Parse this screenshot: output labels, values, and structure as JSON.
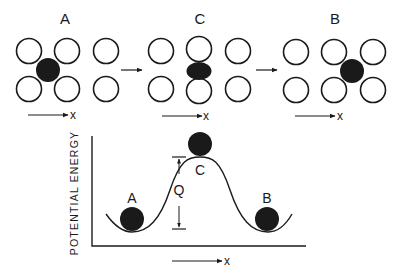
{
  "diagram": {
    "panels": [
      {
        "label": "A",
        "axis_label": "x",
        "atom_position": "lattice-site-A"
      },
      {
        "label": "C",
        "axis_label": "x",
        "atom_position": "saddle-point-C"
      },
      {
        "label": "B",
        "axis_label": "x",
        "atom_position": "lattice-site-B"
      }
    ],
    "energy_plot": {
      "ylabel": "POTENTIAL ENERGY",
      "xlabel": "x",
      "points": [
        {
          "label": "A",
          "role": "minimum"
        },
        {
          "label": "C",
          "role": "maximum"
        },
        {
          "label": "B",
          "role": "minimum"
        }
      ],
      "barrier_label": "Q"
    },
    "colors": {
      "ink": "#1a1a1a",
      "background": "#ffffff"
    }
  }
}
